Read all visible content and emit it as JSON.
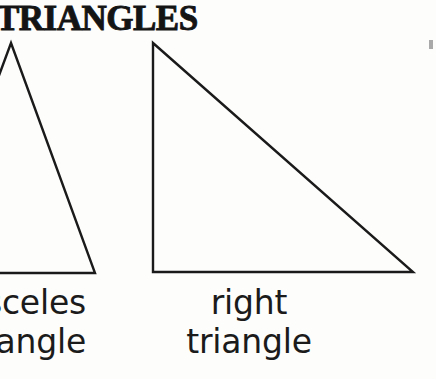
{
  "page": {
    "title": "TRIANGLES",
    "background_color": "#fdfdfc",
    "ink_color": "#141414"
  },
  "figures": [
    {
      "name": "isosceles-triangle",
      "clipped": true,
      "clipped_edge": "left",
      "stroke_color": "#1a1a1a",
      "stroke_width": 2.4,
      "points": "11,43 95,273 -74,273"
    },
    {
      "name": "right-triangle",
      "clipped": false,
      "stroke_color": "#1a1a1a",
      "stroke_width": 2.4,
      "points": "153,43 413,272 153,272"
    }
  ],
  "captions": [
    {
      "name": "isosceles-triangle-caption",
      "clipped": true,
      "clipped_edge": "left",
      "full_text": "isosceles triangle",
      "line1": "isosceles",
      "line2": "triangle"
    },
    {
      "name": "right-triangle-caption",
      "clipped": false,
      "full_text": "right triangle",
      "line1": "right",
      "line2": "triangle"
    }
  ]
}
